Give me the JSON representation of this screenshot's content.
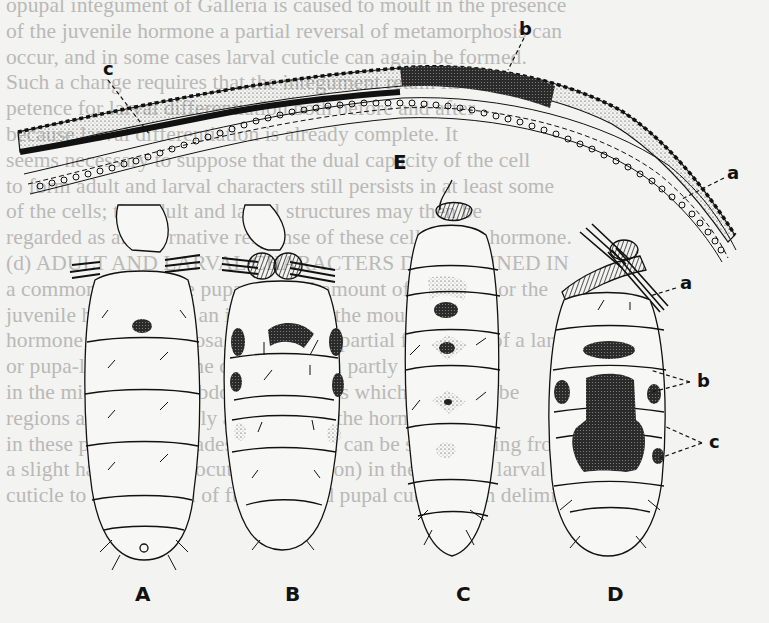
{
  "page": {
    "background_text_lines": [
      "opupal integument of Galleria is caused to moult in the presence",
      "of the juvenile hormone a partial reversal of metamorphosis can",
      "occur, and in some cases larval cuticle can again be formed.",
      "Such a change requires that the integument retain its own com-",
      "petence for larval differentiation both before and after",
      "because larval differentiation is already complete. It",
      "seems necessary to suppose that the dual capacity of the cell",
      "to form adult and larval characters still persists in at least some",
      "of the cells; the adult and larval structures may then be",
      "regarded as an alternative response of these cells to the hormone.",
      "(d) ADULT AND LARVAL CHARACTERS DETERMINED IN",
      "a common cell. In the pupa, a small amount of hormone or the",
      "juvenile hormone has an influence of the moulting",
      "hormone; but not in dosage, results in partial formation of a larva",
      "or pupa-like form in the cuticle, and in partly in patches",
      "in the midline of the abdominal regions which appear to be",
      "regions and respectively according to the hormone. And",
      "in these patches all grades of pupation can be seen, ranging from",
      "a slight hardening (exocuticle formation) in the existing larval",
      "cuticle to a small area of fully formed pupal cuticle with delimited"
    ]
  },
  "figure": {
    "panel_labels": [
      "A",
      "B",
      "C",
      "D",
      "E"
    ],
    "annotations": {
      "section_E": [
        "c",
        "b",
        "a"
      ],
      "larva_D": [
        "a",
        "b",
        "c"
      ]
    },
    "colors": {
      "ink": "#111111",
      "paper": "#f3f3f1",
      "bleed_text": "#b9b9b7"
    }
  }
}
